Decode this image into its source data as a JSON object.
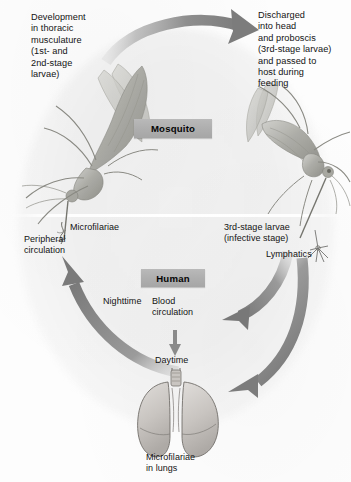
{
  "figure": {
    "background_color": "#fdfdfd",
    "accent_gray": "#8c8c8c",
    "box_gray": "#aeaeae"
  },
  "stage_boxes": {
    "mosquito": "Mosquito",
    "human": "Human"
  },
  "labels": {
    "development": "Development\nin thoracic\nmusculature\n(1st- and\n2nd-stage\nlarvae)",
    "discharged": "Discharged\ninto head\nand proboscis\n(3rd-stage larvae)\nand passed to\nhost during\nfeeding",
    "microfilariae": "Microfilariae",
    "peripheral_circulation": "Peripheral\ncirculation",
    "third_stage_larvae": "3rd-stage larvae\n(infective stage)",
    "lymphatics": "Lymphatics",
    "nighttime": "Nighttime",
    "blood_circulation": "Blood\ncirculation",
    "daytime": "Daytime",
    "microfilariae_in_lungs": "Microfilariae\nin lungs"
  },
  "illustrations": {
    "mosquito_left": "mosquito-left-illustration",
    "mosquito_right": "mosquito-right-illustration",
    "lungs": "lungs-illustration",
    "microfilaria_squiggle": "microfilaria-worm-glyph",
    "lymphatic_vessel": "lymphatic-vessel-glyph"
  },
  "arrows": {
    "top": "top-curved-arrow-right",
    "left": "left-curved-arrow-up",
    "right_to_human": "right-curved-arrow-left",
    "right_to_lungs": "right-curved-arrow-down",
    "daytime": "daytime-down-arrow"
  }
}
